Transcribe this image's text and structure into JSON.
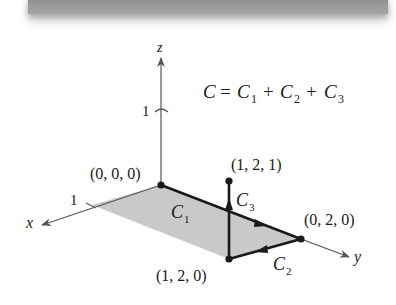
{
  "diagram": {
    "equation": {
      "lhs": "C",
      "equals": "=",
      "terms": [
        {
          "symbol": "C",
          "sub": "1"
        },
        {
          "symbol": "C",
          "sub": "2"
        },
        {
          "symbol": "C",
          "sub": "3"
        }
      ],
      "plus": "+"
    },
    "axes": {
      "x": {
        "label": "x",
        "tick": "1"
      },
      "y": {
        "label": "y"
      },
      "z": {
        "label": "z",
        "tick": "1"
      }
    },
    "points": [
      {
        "label": "(0, 0, 0)"
      },
      {
        "label": "(1, 2, 1)"
      },
      {
        "label": "(0, 2, 0)"
      },
      {
        "label": "(1, 2, 0)"
      }
    ],
    "curves": [
      {
        "symbol": "C",
        "sub": "1"
      },
      {
        "symbol": "C",
        "sub": "2"
      },
      {
        "symbol": "C",
        "sub": "3"
      }
    ],
    "colors": {
      "shade": "#c8c8c8",
      "axis": "#555555",
      "path": "#1a1a1a"
    }
  }
}
